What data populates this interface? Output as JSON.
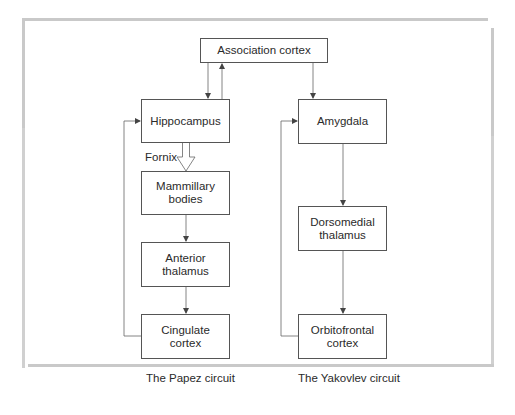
{
  "diagram": {
    "nodes": {
      "association_cortex": "Association cortex",
      "hippocampus": "Hippocampus",
      "mammillary_bodies": "Mammillary\nbodies",
      "anterior_thalamus": "Anterior\nthalamus",
      "cingulate_cortex": "Cingulate\ncortex",
      "amygdala": "Amygdala",
      "dorsomedial_thalamus": "Dorsomedial\nthalamus",
      "orbitofrontal_cortex": "Orbitofrontal\ncortex"
    },
    "edge_labels": {
      "fornix": "Fornix"
    },
    "captions": {
      "papez": "The Papez circuit",
      "yakovlev": "The Yakovlev circuit"
    },
    "edges": [
      {
        "from": "Association cortex",
        "to": "Hippocampus"
      },
      {
        "from": "Hippocampus",
        "to": "Association cortex"
      },
      {
        "from": "Association cortex",
        "to": "Amygdala"
      },
      {
        "from": "Hippocampus",
        "to": "Mammillary bodies",
        "label": "Fornix"
      },
      {
        "from": "Mammillary bodies",
        "to": "Anterior thalamus"
      },
      {
        "from": "Anterior thalamus",
        "to": "Cingulate cortex"
      },
      {
        "from": "Cingulate cortex",
        "to": "Hippocampus"
      },
      {
        "from": "Amygdala",
        "to": "Dorsomedial thalamus"
      },
      {
        "from": "Dorsomedial thalamus",
        "to": "Orbitofrontal cortex"
      },
      {
        "from": "Orbitofrontal cortex",
        "to": "Amygdala"
      }
    ]
  }
}
